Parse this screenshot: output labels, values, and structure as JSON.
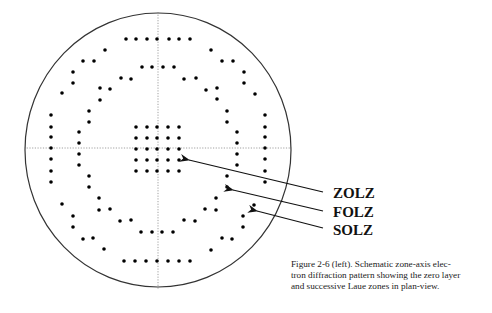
{
  "figure": {
    "circle": {
      "cx": 158,
      "cy": 150,
      "rx": 133,
      "ry": 137
    },
    "axes": {
      "h": {
        "x1": 24,
        "x2": 292,
        "y": 148
      },
      "v": {
        "x": 158,
        "y1": 12,
        "y2": 289
      }
    },
    "colors": {
      "dot": "#000000",
      "line": "#333333",
      "axis": "#888888"
    },
    "zones": {
      "zolz": {
        "name": "ZOLZ",
        "points": [
          [
            136,
            127
          ],
          [
            147,
            127
          ],
          [
            157,
            127
          ],
          [
            168,
            127
          ],
          [
            179,
            127
          ],
          [
            136,
            138
          ],
          [
            147,
            138
          ],
          [
            157,
            138
          ],
          [
            168,
            138
          ],
          [
            179,
            138
          ],
          [
            136,
            149
          ],
          [
            147,
            149
          ],
          [
            157,
            149
          ],
          [
            168,
            149
          ],
          [
            179,
            149
          ],
          [
            136,
            160
          ],
          [
            147,
            160
          ],
          [
            157,
            160
          ],
          [
            168,
            160
          ],
          [
            179,
            160
          ],
          [
            136,
            171
          ],
          [
            147,
            171
          ],
          [
            157,
            171
          ],
          [
            168,
            171
          ],
          [
            179,
            171
          ]
        ]
      },
      "folz": {
        "name": "FOLZ",
        "points": [
          [
            142,
            67
          ],
          [
            152,
            67
          ],
          [
            163,
            67
          ],
          [
            174,
            67
          ],
          [
            121,
            78
          ],
          [
            131,
            79
          ],
          [
            184,
            79
          ],
          [
            196,
            78
          ],
          [
            100,
            88
          ],
          [
            110,
            89
          ],
          [
            206,
            90
          ],
          [
            217,
            88
          ],
          [
            100,
            100
          ],
          [
            217,
            99
          ],
          [
            89,
            111
          ],
          [
            89,
            122
          ],
          [
            227,
            111
          ],
          [
            227,
            122
          ],
          [
            79,
            132
          ],
          [
            79,
            143
          ],
          [
            79,
            154
          ],
          [
            79,
            165
          ],
          [
            237,
            132
          ],
          [
            237,
            143
          ],
          [
            237,
            154
          ],
          [
            237,
            165
          ],
          [
            89,
            176
          ],
          [
            89,
            187
          ],
          [
            227,
            176
          ],
          [
            227,
            187
          ],
          [
            99,
            198
          ],
          [
            216,
            198
          ],
          [
            99,
            210
          ],
          [
            110,
            209
          ],
          [
            205,
            209
          ],
          [
            216,
            210
          ],
          [
            120,
            221
          ],
          [
            131,
            220
          ],
          [
            184,
            220
          ],
          [
            195,
            221
          ],
          [
            141,
            232
          ],
          [
            152,
            232
          ],
          [
            162,
            232
          ],
          [
            173,
            232
          ]
        ]
      },
      "solz": {
        "name": "SOLZ",
        "points": [
          [
            126,
            39
          ],
          [
            136,
            39
          ],
          [
            147,
            39
          ],
          [
            157,
            39
          ],
          [
            169,
            39
          ],
          [
            179,
            39
          ],
          [
            190,
            39
          ],
          [
            105,
            50
          ],
          [
            211,
            50
          ],
          [
            83,
            61
          ],
          [
            94,
            61
          ],
          [
            222,
            61
          ],
          [
            233,
            61
          ],
          [
            73,
            72
          ],
          [
            73,
            83
          ],
          [
            244,
            72
          ],
          [
            244,
            83
          ],
          [
            62,
            93
          ],
          [
            255,
            94
          ],
          [
            51,
            115
          ],
          [
            51,
            127
          ],
          [
            51,
            137
          ],
          [
            51,
            148
          ],
          [
            51,
            159
          ],
          [
            51,
            171
          ],
          [
            51,
            182
          ],
          [
            265,
            115
          ],
          [
            265,
            127
          ],
          [
            265,
            137
          ],
          [
            265,
            148
          ],
          [
            265,
            159
          ],
          [
            265,
            171
          ],
          [
            265,
            182
          ],
          [
            62,
            204
          ],
          [
            254,
            205
          ],
          [
            73,
            216
          ],
          [
            73,
            227
          ],
          [
            243,
            216
          ],
          [
            243,
            227
          ],
          [
            83,
            239
          ],
          [
            93,
            238
          ],
          [
            222,
            238
          ],
          [
            232,
            239
          ],
          [
            104,
            249
          ],
          [
            211,
            250
          ],
          [
            124,
            261
          ],
          [
            135,
            261
          ],
          [
            146,
            261
          ],
          [
            157,
            261
          ],
          [
            168,
            261
          ],
          [
            179,
            261
          ],
          [
            190,
            261
          ]
        ]
      }
    },
    "arrows": [
      {
        "label": "ZOLZ",
        "from": [
          323,
          192
        ],
        "to": [
          189,
          160
        ]
      },
      {
        "label": "FOLZ",
        "from": [
          323,
          211
        ],
        "to": [
          233,
          190
        ]
      },
      {
        "label": "SOLZ",
        "from": [
          323,
          228
        ],
        "to": [
          257,
          211
        ]
      }
    ]
  },
  "labels": {
    "zolz": "ZOLZ",
    "folz": "FOLZ",
    "solz": "SOLZ"
  },
  "caption": {
    "line1": "Figure 2-6 (left).  Schematic zone-axis elec-",
    "line2": "tron diffraction pattern showing the zero layer",
    "line3": "and successive Laue zones in plan-view."
  }
}
